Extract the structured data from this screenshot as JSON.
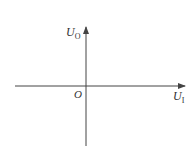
{
  "diagram": {
    "type": "coordinate-axes",
    "x_axis": {
      "label": "U",
      "subscript": "I"
    },
    "y_axis": {
      "label": "U",
      "subscript": "O"
    },
    "origin_label": "O",
    "colors": {
      "axis": "#444444",
      "text": "#333333",
      "background": "#ffffff"
    }
  }
}
